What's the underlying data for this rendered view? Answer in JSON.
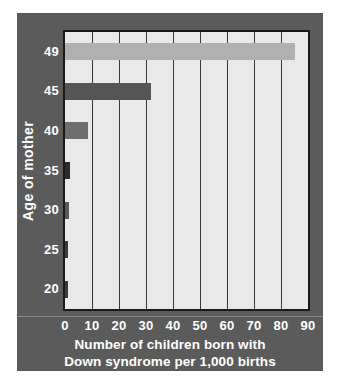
{
  "chart_data": {
    "type": "bar",
    "orientation": "horizontal",
    "title": "",
    "xlabel": "Number of children born with Down syndrome per 1,000 births",
    "xlabel_lines": [
      "Number of children born with",
      "Down syndrome per 1,000 births"
    ],
    "ylabel": "Age of mother",
    "categories": [
      "20",
      "25",
      "30",
      "35",
      "40",
      "45",
      "49"
    ],
    "values": [
      1,
      1,
      1.5,
      2,
      8.5,
      32,
      85
    ],
    "bar_colors": [
      "#3a3a3a",
      "#3a3a3a",
      "#5a5a5a",
      "#2b2b2b",
      "#6e6e6e",
      "#555555",
      "#b0b0b0"
    ],
    "xlim": [
      0,
      90
    ],
    "xticks": [
      "0",
      "10",
      "20",
      "30",
      "40",
      "50",
      "60",
      "70",
      "80",
      "90"
    ],
    "xtick_values": [
      0,
      10,
      20,
      30,
      40,
      50,
      60,
      70,
      80,
      90
    ],
    "grid": true,
    "grid_axis": "x",
    "legend": "none",
    "background_color": "#5b5b5b",
    "plot_background_color": "#e9e9e9",
    "text_color": "#ffffff",
    "axis_border_color": "#1a1a1a"
  }
}
